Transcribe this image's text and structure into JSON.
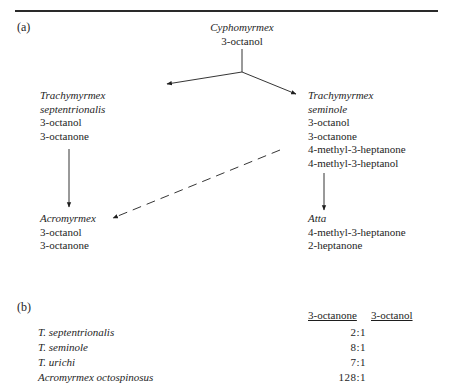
{
  "panel_a": {
    "label": "(a)",
    "root": {
      "genus": "Cyphomyrmex",
      "compounds": [
        "3-octanol"
      ]
    },
    "t_septentrionalis": {
      "genus": "Trachymyrmex",
      "species": "septentrionalis",
      "compounds": [
        "3-octanol",
        "3-octanone"
      ]
    },
    "t_seminole": {
      "genus": "Trachymyrmex",
      "species": "seminole",
      "compounds": [
        "3-octanol",
        "3-octanone",
        "4-methyl-3-heptanone",
        "4-methyl-3-heptanol"
      ]
    },
    "acromyrmex": {
      "genus": "Acromyrmex",
      "compounds": [
        "3-octanol",
        "3-octanone"
      ]
    },
    "atta": {
      "genus": "Atta",
      "compounds": [
        "4-methyl-3-heptanone",
        "2-heptanone"
      ]
    },
    "edges": [
      {
        "from": "Cyphomyrmex",
        "to": "Trachymyrmex septentrionalis",
        "style": "solid"
      },
      {
        "from": "Cyphomyrmex",
        "to": "Trachymyrmex seminole",
        "style": "solid"
      },
      {
        "from": "Trachymyrmex septentrionalis",
        "to": "Acromyrmex",
        "style": "solid"
      },
      {
        "from": "Trachymyrmex seminole",
        "to": "Acromyrmex",
        "style": "dashed"
      },
      {
        "from": "Trachymyrmex seminole",
        "to": "Atta",
        "style": "solid"
      }
    ]
  },
  "panel_b": {
    "label": "(b)",
    "headers": [
      "3-octanone",
      "3-octanol"
    ],
    "rows": [
      {
        "species": "T. septentrionalis",
        "ratio": "2:1"
      },
      {
        "species": "T. seminole",
        "ratio": "8:1"
      },
      {
        "species": "T. urichi",
        "ratio": "7:1"
      },
      {
        "species": "Acromyrmex octospinosus",
        "ratio": "128:1"
      }
    ]
  }
}
